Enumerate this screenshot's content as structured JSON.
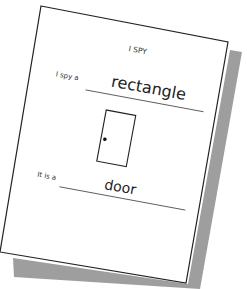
{
  "worksheet": {
    "title": "I SPY",
    "prompt1": "I spy a",
    "answer1": "rectangle",
    "prompt2": "It is a",
    "answer2": "door",
    "drawing": "door-drawing",
    "colors": {
      "paper": "#ffffff",
      "shadow": "#9e9e9e",
      "ink": "#222222"
    }
  }
}
